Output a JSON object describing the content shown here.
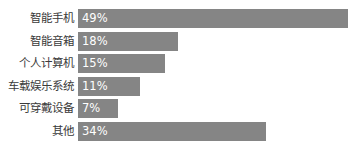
{
  "chart_data": {
    "type": "bar",
    "orientation": "horizontal",
    "title": "",
    "subtitle": "",
    "xlabel": "",
    "ylabel": "",
    "grid": false,
    "legend": null,
    "legend_position": "none",
    "axis_visible": false,
    "tick_labels": [],
    "xlim": [
      0,
      49
    ],
    "categories": [
      "智能手机",
      "智能音箱",
      "个人计算机",
      "车载娱乐系统",
      "可穿戴设备",
      "其他"
    ],
    "values": [
      49,
      18,
      15,
      11,
      7,
      34
    ],
    "value_labels": [
      "49%",
      "18%",
      "15%",
      "11%",
      "7%",
      "34%"
    ],
    "bar_color": "#858585",
    "label_color": "#3a3a3a",
    "value_label_color": "#ffffff",
    "background_color": "#ffffff"
  },
  "rows": [
    {
      "label": "智能手机",
      "value_label": "49%",
      "bar_width_px": 270,
      "top_px": 9
    },
    {
      "label": "智能音箱",
      "value_label": "18%",
      "bar_width_px": 100,
      "top_px": 32
    },
    {
      "label": "个人计算机",
      "value_label": "15%",
      "bar_width_px": 87,
      "top_px": 54
    },
    {
      "label": "车载娱乐系统",
      "value_label": "11%",
      "bar_width_px": 62,
      "top_px": 77
    },
    {
      "label": "可穿戴设备",
      "value_label": "7%",
      "bar_width_px": 40,
      "top_px": 99
    },
    {
      "label": "其他",
      "value_label": "34%",
      "bar_width_px": 188,
      "top_px": 122
    }
  ]
}
